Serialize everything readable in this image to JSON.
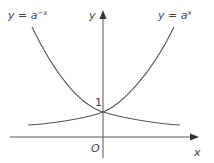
{
  "diagram": {
    "curves": [
      {
        "name": "y = a^-x",
        "label_lhs": "y = a",
        "label_exp": "−x"
      },
      {
        "name": "y = a^x",
        "label_lhs": "y = a",
        "label_exp": "x"
      }
    ],
    "axes": {
      "x_label": "x",
      "y_label": "y",
      "origin_label": "O",
      "y_intercept_label": "1"
    },
    "colors": {
      "curve": "#555555",
      "axis": "#555555",
      "text": "#444444"
    }
  }
}
